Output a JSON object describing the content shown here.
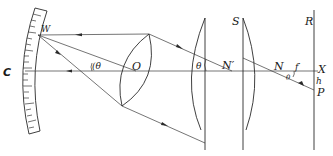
{
  "diagram": {
    "type": "optical-ray-diagram",
    "labels": {
      "C": "C",
      "W": "W",
      "theta_left": "(θ",
      "O": "O",
      "theta_mid": "θ",
      "N_prime": "N′",
      "S": "S",
      "N": "N",
      "f_prime": "f′",
      "theta_small": "θ",
      "R": "R",
      "X": "X",
      "h": "h",
      "P": "P"
    },
    "elements": [
      {
        "id": "scale",
        "label": "C",
        "description": "curved graduated scale"
      },
      {
        "id": "lens",
        "label": "O",
        "description": "biconvex lens"
      },
      {
        "id": "plate-1",
        "description": "plano-convex plate"
      },
      {
        "id": "plate-S",
        "label": "S",
        "description": "plano-convex plate"
      },
      {
        "id": "screen-R",
        "label": "R",
        "description": "reference plane"
      }
    ],
    "colors": {
      "line": "#2a2a2a",
      "background": "#ffffff"
    }
  }
}
